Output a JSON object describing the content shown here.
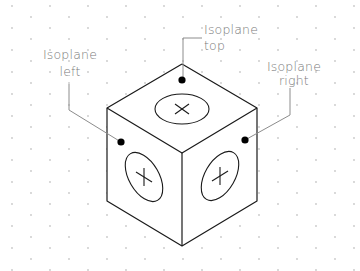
{
  "diagram": {
    "type": "isometric-cube-isoplanes",
    "labels": {
      "left": {
        "line1": "Isoplane",
        "line2": "left"
      },
      "top": {
        "line1": "Isoplane",
        "line2": "top"
      },
      "right": {
        "line1": "Isoplane",
        "line2": "right"
      }
    },
    "colors": {
      "background": "#ffffff",
      "edge": "#1a1a1a",
      "label": "#7a7a7a",
      "leader": "#8c8c8c",
      "grid_dot": "#c8c8c8",
      "marker": "#000000"
    },
    "faces": [
      {
        "name": "top",
        "symbol": "circle-with-cross"
      },
      {
        "name": "left",
        "symbol": "circle-with-cross"
      },
      {
        "name": "right",
        "symbol": "circle-with-cross"
      }
    ],
    "background_grid": "isometric-dot-grid"
  }
}
